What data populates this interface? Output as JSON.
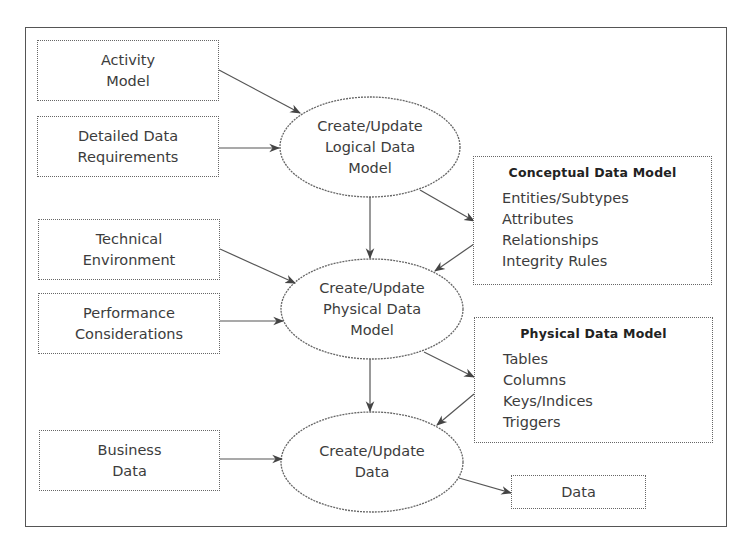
{
  "inputs": [
    {
      "id": "activity-model",
      "lines": [
        "Activity",
        "Model"
      ]
    },
    {
      "id": "detailed-data-requirements",
      "lines": [
        "Detailed Data",
        "Requirements"
      ]
    },
    {
      "id": "technical-environment",
      "lines": [
        "Technical",
        "Environment"
      ]
    },
    {
      "id": "performance-considerations",
      "lines": [
        "Performance",
        "Considerations"
      ]
    },
    {
      "id": "business-data",
      "lines": [
        "Business",
        "Data"
      ]
    }
  ],
  "processes": [
    {
      "id": "create-update-logical",
      "lines": [
        "Create/Update",
        "Logical Data",
        "Model"
      ]
    },
    {
      "id": "create-update-physical",
      "lines": [
        "Create/Update",
        "Physical Data",
        "Model"
      ]
    },
    {
      "id": "create-update-data",
      "lines": [
        "Create/Update",
        "Data"
      ]
    }
  ],
  "outputs": {
    "conceptual": {
      "title": "Conceptual Data Model",
      "items": [
        "Entities/Subtypes",
        "Attributes",
        "Relationships",
        "Integrity Rules"
      ]
    },
    "physical": {
      "title": "Physical Data Model",
      "items": [
        "Tables",
        "Columns",
        "Keys/Indices",
        "Triggers"
      ]
    },
    "data": {
      "label": "Data"
    }
  },
  "colors": {
    "stroke": "#555555",
    "text": "#3c3c3c",
    "background": "#ffffff"
  }
}
